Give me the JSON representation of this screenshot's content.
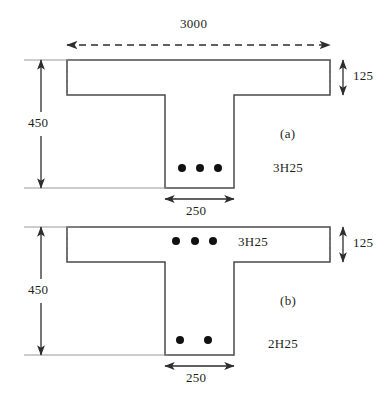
{
  "figure": {
    "type": "engineering-drawing",
    "units": "mm"
  },
  "sections": [
    {
      "id": "a",
      "tag": "(a)",
      "flange_width_label": "3000",
      "flange_depth_label": "125",
      "overall_depth_label": "450",
      "web_width_label": "250",
      "rebar_label": "3H25",
      "rebar_count": 3,
      "rebar_position": "web-bottom"
    },
    {
      "id": "b",
      "tag": "(b)",
      "flange_depth_label": "125",
      "overall_depth_label": "450",
      "web_width_label": "250",
      "flange_rebar_label": "3H25",
      "flange_rebar_count": 3,
      "web_rebar_label": "2H25",
      "web_rebar_count": 2
    }
  ],
  "colors": {
    "line": "#3b3b3b",
    "text": "#231f20",
    "rebar": "#111111",
    "background": "#ffffff"
  }
}
